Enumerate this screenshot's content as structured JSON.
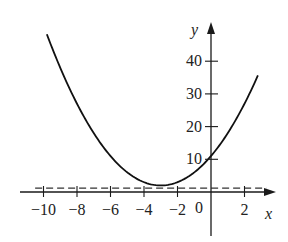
{
  "chart_data": {
    "type": "line",
    "title": "",
    "xlabel": "x",
    "ylabel": "y",
    "xlim": [
      -10.5,
      3.5
    ],
    "ylim": [
      -4,
      52
    ],
    "grid": false,
    "legend": null,
    "x_ticks": [
      -10,
      -8,
      -6,
      -4,
      -2,
      2
    ],
    "x_tick_labels": [
      "−10",
      "−8",
      "−6",
      "−4",
      "−2",
      "2"
    ],
    "origin_label": "0",
    "y_ticks": [
      10,
      20,
      30,
      40
    ],
    "y_tick_labels": [
      "10",
      "20",
      "30",
      "40"
    ],
    "series": [
      {
        "name": "curve",
        "style": "solid",
        "description": "parabola-like curve, minimum near (-3, 2)",
        "x": [
          -9.8,
          -9,
          -8,
          -7,
          -6,
          -5,
          -4,
          -3,
          -2,
          -1,
          0,
          1,
          2,
          2.8
        ],
        "y": [
          48,
          38,
          27,
          18,
          11,
          6,
          3,
          2,
          3,
          6,
          11,
          18,
          27,
          36
        ]
      },
      {
        "name": "dashed-line",
        "style": "dashed",
        "description": "horizontal dashed line just above x-axis",
        "x": [
          -10.5,
          3.3
        ],
        "y": [
          1.2,
          1.2
        ]
      }
    ]
  }
}
